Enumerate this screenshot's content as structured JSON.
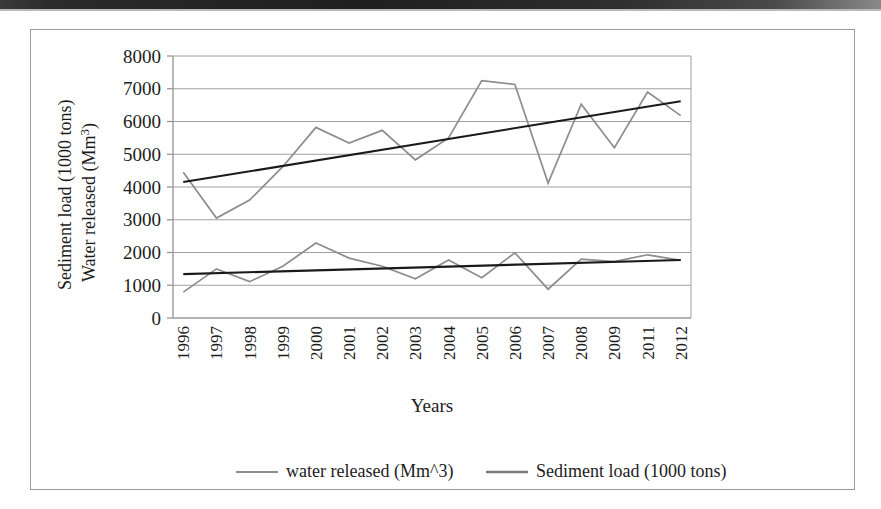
{
  "chart_data": {
    "type": "line",
    "title": "",
    "xlabel": "Years",
    "ylabel": "Sediment load (1000 tons)\nWater released (Mm³)",
    "ylabel_line1": "Sediment load (1000 tons)",
    "ylabel_line2_prefix": "Water released (Mm",
    "ylabel_line2_sup": "3",
    "ylabel_line2_suffix": ")",
    "categories": [
      "1996",
      "1997",
      "1998",
      "1999",
      "2000",
      "2001",
      "2002",
      "2003",
      "2004",
      "2005",
      "2006",
      "2007",
      "2008",
      "2009",
      "2011",
      "2012"
    ],
    "ylim": [
      0,
      8000
    ],
    "ytick_labels": [
      "8000",
      "7000",
      "6000",
      "5000",
      "4000",
      "3000",
      "2000",
      "1000",
      "0"
    ],
    "ytick_values": [
      8000,
      7000,
      6000,
      5000,
      4000,
      3000,
      2000,
      1000,
      0
    ],
    "grid": true,
    "legend_position": "bottom",
    "series": [
      {
        "name": "water released (Mm^3)",
        "color": "#8d8d8d",
        "values": [
          4450,
          3050,
          3600,
          4620,
          5820,
          5340,
          5730,
          4830,
          5500,
          7250,
          7130,
          4120,
          6530,
          5200,
          6900,
          6180
        ],
        "trendline": {
          "name": "water released trend",
          "color": "#1a1a1a",
          "start_value": 4150,
          "end_value": 6620
        }
      },
      {
        "name": "Sediment load (1000 tons)",
        "color": "#8d8d8d",
        "values": [
          790,
          1500,
          1110,
          1580,
          2290,
          1830,
          1580,
          1200,
          1770,
          1230,
          1990,
          880,
          1800,
          1720,
          1930,
          1760
        ],
        "trendline": {
          "name": "sediment load trend",
          "color": "#1a1a1a",
          "start_value": 1340,
          "end_value": 1770
        }
      }
    ],
    "legend": [
      {
        "label": "water released (Mm^3)",
        "color": "#8d8d8d"
      },
      {
        "label": "Sediment load (1000 tons)",
        "color": "#7a7a7a"
      }
    ]
  },
  "colors": {
    "series": "#8d8d8d",
    "trend": "#1a1a1a",
    "grid": "#a0a0a0",
    "frame": "#9a9a9a",
    "text": "#1c1c1c",
    "background": "#ffffff"
  }
}
